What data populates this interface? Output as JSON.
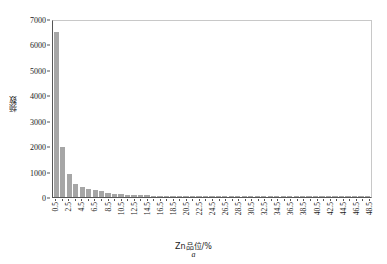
{
  "chart_data": {
    "type": "bar",
    "title": "",
    "xlabel": "Zn品位/%",
    "ylabel": "频数",
    "caption": "a",
    "grid": false,
    "legend": null,
    "ylim": [
      0,
      7000
    ],
    "ytick_values": [
      7000,
      6000,
      5000,
      4000,
      3000,
      2000,
      1000,
      0
    ],
    "ytick_labels": [
      "7000",
      "6000",
      "5000",
      "4000",
      "3000",
      "2000",
      "1000",
      "0"
    ],
    "bar_color": "#a6a6a6",
    "axis_color": "#555555",
    "frame_color": "#c8c8c8",
    "xtick_labels_shown": [
      "0.5",
      "2.5",
      "4.5",
      "6.5",
      "8.5",
      "10.5",
      "12.5",
      "14.5",
      "16.5",
      "18.5",
      "20.5",
      "22.5",
      "24.5",
      "26.5",
      "28.5",
      "30.5",
      "32.5",
      "34.5",
      "36.5",
      "38.5",
      "40.5",
      "42.5",
      "44.5",
      "46.5",
      "48.5"
    ],
    "categories": [
      "0.5",
      "1.5",
      "2.5",
      "3.5",
      "4.5",
      "5.5",
      "6.5",
      "7.5",
      "8.5",
      "9.5",
      "10.5",
      "11.5",
      "12.5",
      "13.5",
      "14.5",
      "15.5",
      "16.5",
      "17.5",
      "18.5",
      "19.5",
      "20.5",
      "21.5",
      "22.5",
      "23.5",
      "24.5",
      "25.5",
      "26.5",
      "27.5",
      "28.5",
      "29.5",
      "30.5",
      "31.5",
      "32.5",
      "33.5",
      "34.5",
      "35.5",
      "36.5",
      "37.5",
      "38.5",
      "39.5",
      "40.5",
      "41.5",
      "42.5",
      "43.5",
      "44.5",
      "45.5",
      "46.5",
      "47.5",
      "48.5"
    ],
    "values": [
      6480,
      1960,
      900,
      520,
      400,
      330,
      280,
      230,
      150,
      120,
      110,
      95,
      85,
      70,
      65,
      55,
      50,
      45,
      40,
      35,
      32,
      28,
      26,
      24,
      22,
      20,
      18,
      17,
      16,
      15,
      14,
      13,
      12,
      11,
      10,
      9,
      9,
      8,
      8,
      7,
      7,
      6,
      6,
      5,
      5,
      4,
      4,
      3,
      3
    ]
  }
}
